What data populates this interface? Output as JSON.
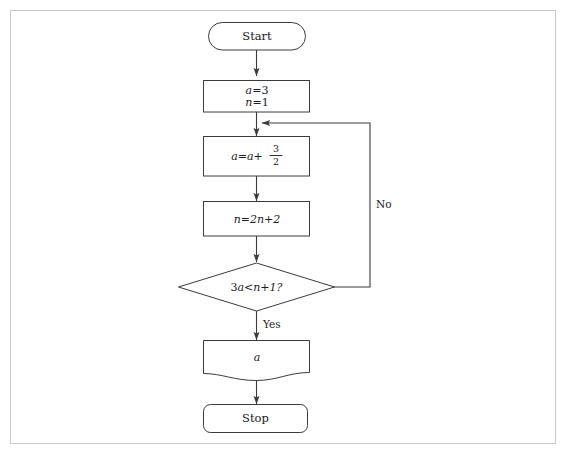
{
  "figure": {
    "background_color": "#ffffff",
    "frame_color": "#c9c9c9",
    "stroke_color": "#3b3b3b",
    "text_color": "#1a1a1a"
  },
  "nodes": {
    "start": {
      "label": "Start",
      "shape": "stadium"
    },
    "init": {
      "line1_lhs": "a",
      "line1_op": "=",
      "line1_rhs": "3",
      "line2_lhs": "n",
      "line2_op": "=",
      "line2_rhs": "1",
      "shape": "rectangle"
    },
    "update_a": {
      "lhs": "a",
      "op": "=",
      "rhs_var": "a",
      "plus": "+",
      "frac_numerator": "3",
      "frac_denominator": "2",
      "shape": "rectangle"
    },
    "update_n": {
      "text": "n=2n+2",
      "lhs": "n",
      "op": "=",
      "rhs": "2n+2",
      "shape": "rectangle"
    },
    "decision": {
      "text": "3a<n+1?",
      "lhs": "3a",
      "op": "<",
      "rhs": "n+1?",
      "shape": "diamond"
    },
    "output": {
      "label": "a",
      "shape": "document"
    },
    "stop": {
      "label": "Stop",
      "shape": "rounded-rectangle"
    }
  },
  "edges": {
    "yes_label": "Yes",
    "no_label": "No"
  }
}
